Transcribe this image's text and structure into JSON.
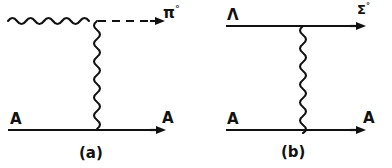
{
  "figure": {
    "kind": "feynman-diagrams",
    "background_color": "#ffffff",
    "ink_color": "#111111",
    "panels": [
      {
        "id": "a",
        "caption": "(a)",
        "top_line": {
          "left_style": "wavy",
          "right_style": "dashed",
          "arrow": "right",
          "incoming_label": "",
          "outgoing_label": "π",
          "outgoing_superscript": "°"
        },
        "bottom_line": {
          "style": "solid",
          "arrow": "right",
          "incoming_label": "A",
          "outgoing_label": "A"
        },
        "propagator": {
          "style": "wavy",
          "orientation": "vertical"
        }
      },
      {
        "id": "b",
        "caption": "(b)",
        "top_line": {
          "left_style": "solid",
          "right_style": "solid",
          "arrow": "right",
          "incoming_label": "Λ",
          "outgoing_label": "Σ",
          "outgoing_superscript": "°"
        },
        "bottom_line": {
          "style": "solid",
          "arrow": "right",
          "incoming_label": "A",
          "outgoing_label": "A"
        },
        "propagator": {
          "style": "wavy",
          "orientation": "vertical"
        }
      }
    ]
  }
}
